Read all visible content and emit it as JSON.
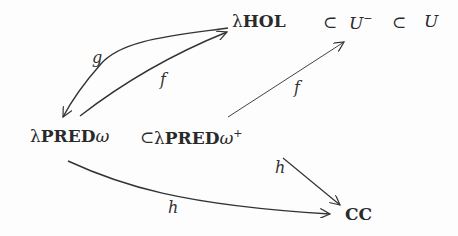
{
  "diagram": {
    "nodes": {
      "lhol": {
        "lambda": "λ",
        "name": "HOL"
      },
      "subset1": "⊂",
      "u_minus": {
        "base": "U",
        "sup": "−"
      },
      "subset2": "⊂",
      "u": "U",
      "lpred_omega": {
        "lambda": "λ",
        "name": "PRED",
        "suffix": "ω"
      },
      "subset3": "⊂",
      "lpred_omega_plus": {
        "lambda": "λ",
        "name": "PRED",
        "suffix": "ω",
        "sup": "+"
      },
      "cc": "CC"
    },
    "edges": [
      {
        "from": "λHOL",
        "to": "λPREDω",
        "label": "g"
      },
      {
        "from": "λPREDω",
        "to": "λHOL",
        "label": "f"
      },
      {
        "from": "λPREDω⁺",
        "to": "U⁻",
        "label": "f"
      },
      {
        "from": "λPREDω⁺",
        "to": "CC",
        "label": "h"
      },
      {
        "from": "λPREDω",
        "to": "CC",
        "label": "h"
      }
    ],
    "colors": {
      "ink": "#2a2a2a",
      "background": "#fdfdfd"
    }
  }
}
